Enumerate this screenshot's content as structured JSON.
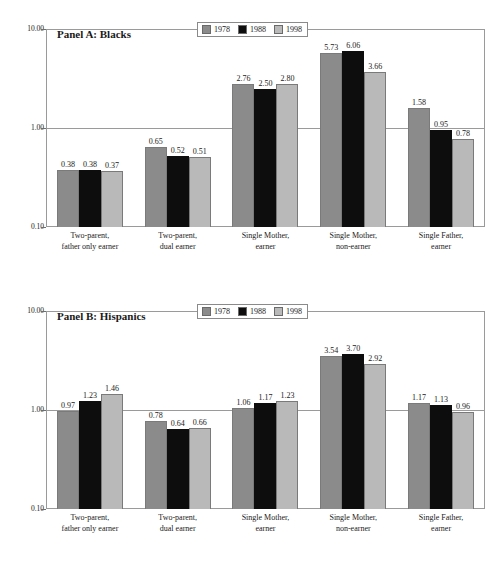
{
  "figure": {
    "width": 503,
    "height": 564,
    "background": "#ffffff"
  },
  "colors": {
    "series_1978": "#8b8b8b",
    "series_1988": "#0d0d0d",
    "series_1998": "#b9b9b9",
    "axis": "#9a9a9a",
    "text": "#1a1a1a"
  },
  "chart_data": [
    {
      "type": "bar",
      "title": "Panel A: Blacks",
      "xlabel": "",
      "ylabel": "",
      "yscale": "log",
      "ylim": [
        0.1,
        10.0
      ],
      "yticks": [
        "10.00",
        "1.00",
        "0.10"
      ],
      "ytick_values": [
        10.0,
        1.0,
        0.1
      ],
      "grid": true,
      "gridlines_at": [
        1.0
      ],
      "legend_position": "top-center",
      "legend": [
        "1978",
        "1988",
        "1998"
      ],
      "categories": [
        "Two-parent, father only earner",
        "Two-parent, dual earner",
        "Single Mother, earner",
        "Single Mother, non-earner",
        "Single Father, earner"
      ],
      "categories_lines": [
        [
          "Two-parent,",
          "father only earner"
        ],
        [
          "Two-parent,",
          "dual earner"
        ],
        [
          "Single Mother,",
          "earner"
        ],
        [
          "Single Mother,",
          "non-earner"
        ],
        [
          "Single Father,",
          "earner"
        ]
      ],
      "series": [
        {
          "name": "1978",
          "color": "#8b8b8b",
          "values": [
            0.38,
            0.65,
            2.76,
            5.73,
            1.58
          ]
        },
        {
          "name": "1988",
          "color": "#0d0d0d",
          "values": [
            0.38,
            0.52,
            2.5,
            6.06,
            0.95
          ]
        },
        {
          "name": "1998",
          "color": "#b9b9b9",
          "values": [
            0.37,
            0.51,
            2.8,
            3.66,
            0.78
          ]
        }
      ],
      "data_labels": [
        [
          "0.38",
          "0.38",
          "0.37"
        ],
        [
          "0.65",
          "0.52",
          "0.51"
        ],
        [
          "2.76",
          "2.50",
          "2.80"
        ],
        [
          "5.73",
          "6.06",
          "3.66"
        ],
        [
          "1.58",
          "0.95",
          "0.78"
        ]
      ]
    },
    {
      "type": "bar",
      "title": "Panel B: Hispanics",
      "xlabel": "",
      "ylabel": "",
      "yscale": "log",
      "ylim": [
        0.1,
        10.0
      ],
      "yticks": [
        "10.00",
        "1.00",
        "0.10"
      ],
      "ytick_values": [
        10.0,
        1.0,
        0.1
      ],
      "grid": true,
      "gridlines_at": [
        1.0
      ],
      "legend_position": "top-center",
      "legend": [
        "1978",
        "1988",
        "1998"
      ],
      "categories": [
        "Two-parent, father only earner",
        "Two-parent, dual earner",
        "Single Mother, earner",
        "Single Mother, non-earner",
        "Single Father, earner"
      ],
      "categories_lines": [
        [
          "Two-parent,",
          "father only earner"
        ],
        [
          "Two-parent,",
          "dual earner"
        ],
        [
          "Single Mother,",
          "earner"
        ],
        [
          "Single Mother,",
          "non-earner"
        ],
        [
          "Single Father,",
          "earner"
        ]
      ],
      "series": [
        {
          "name": "1978",
          "color": "#8b8b8b",
          "values": [
            0.97,
            0.78,
            1.06,
            3.54,
            1.17
          ]
        },
        {
          "name": "1988",
          "color": "#0d0d0d",
          "values": [
            1.23,
            0.64,
            1.17,
            3.7,
            1.13
          ]
        },
        {
          "name": "1998",
          "color": "#b9b9b9",
          "values": [
            1.46,
            0.66,
            1.23,
            2.92,
            0.96
          ]
        }
      ],
      "data_labels": [
        [
          "0.97",
          "1.23",
          "1.46"
        ],
        [
          "0.78",
          "0.64",
          "0.66"
        ],
        [
          "1.06",
          "1.17",
          "1.23"
        ],
        [
          "3.54",
          "3.70",
          "2.92"
        ],
        [
          "1.17",
          "1.13",
          "0.96"
        ]
      ]
    }
  ]
}
